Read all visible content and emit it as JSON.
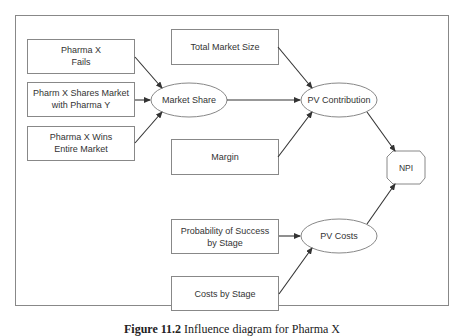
{
  "diagram": {
    "nodes": {
      "pharma_x_fails": {
        "line1": "Pharma X",
        "line2": "Fails"
      },
      "pharma_x_shares": {
        "line1": "Pharm X Shares Market",
        "line2": "with Pharma Y"
      },
      "pharma_x_wins": {
        "line1": "Pharma X Wins",
        "line2": "Entire Market"
      },
      "market_share": {
        "label": "Market Share"
      },
      "total_market_size": {
        "label": "Total Market Size"
      },
      "margin": {
        "label": "Margin"
      },
      "pv_contribution": {
        "label": "PV Contribution"
      },
      "npi": {
        "label": "NPI"
      },
      "probability_success": {
        "line1": "Probability of Success",
        "line2": "by Stage"
      },
      "costs_by_stage": {
        "label": "Costs by Stage"
      },
      "pv_costs": {
        "label": "PV Costs"
      }
    },
    "edges": [
      {
        "from": "Pharma X Fails",
        "to": "Market Share"
      },
      {
        "from": "Pharm X Shares Market with Pharma Y",
        "to": "Market Share"
      },
      {
        "from": "Pharma X Wins Entire Market",
        "to": "Market Share"
      },
      {
        "from": "Market Share",
        "to": "PV Contribution"
      },
      {
        "from": "Total Market Size",
        "to": "PV Contribution"
      },
      {
        "from": "Margin",
        "to": "PV Contribution"
      },
      {
        "from": "PV Contribution",
        "to": "NPI"
      },
      {
        "from": "Probability of Success by Stage",
        "to": "PV Costs"
      },
      {
        "from": "Costs by Stage",
        "to": "PV Costs"
      },
      {
        "from": "PV Costs",
        "to": "NPI"
      }
    ],
    "colors": {
      "stroke": "#555555",
      "text": "#333333",
      "background": "#ffffff"
    }
  },
  "caption": {
    "figure": "Figure 11.2",
    "text": "Influence diagram for Pharma X"
  }
}
